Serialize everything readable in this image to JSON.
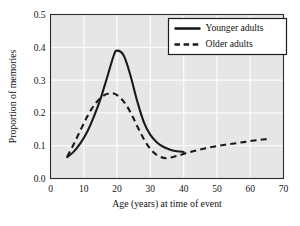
{
  "chart_data": {
    "type": "line",
    "title": "",
    "xlabel": "Age (years) at time of event",
    "ylabel": "Proportion of memories",
    "xlim": [
      0,
      70
    ],
    "ylim": [
      0.0,
      0.5
    ],
    "xticks": [
      "0",
      "10",
      "20",
      "30",
      "40",
      "50",
      "60",
      "70"
    ],
    "yticks": [
      "0.0",
      "0.1",
      "0.2",
      "0.3",
      "0.4",
      "0.5"
    ],
    "grid": true,
    "legend_position": "top-right",
    "background_color": "#e6e6e6",
    "gridline_color": "#fbfbfb",
    "line_color": "#1a1a1a",
    "series": [
      {
        "name": "Younger adults",
        "style": "solid",
        "x": [
          5,
          7,
          9,
          11,
          13,
          15,
          17,
          19,
          20,
          22,
          24,
          26,
          28,
          30,
          32,
          34,
          36,
          38,
          40
        ],
        "values": [
          0.065,
          0.082,
          0.108,
          0.142,
          0.188,
          0.242,
          0.308,
          0.375,
          0.39,
          0.375,
          0.315,
          0.238,
          0.173,
          0.133,
          0.11,
          0.096,
          0.088,
          0.083,
          0.081
        ]
      },
      {
        "name": "Older adults",
        "style": "dashed",
        "x": [
          5,
          7,
          9,
          11,
          13,
          15,
          17,
          19,
          21,
          23,
          25,
          27,
          29,
          31,
          33,
          35,
          38,
          42,
          46,
          50,
          54,
          58,
          62,
          65
        ],
        "values": [
          0.066,
          0.105,
          0.147,
          0.188,
          0.222,
          0.245,
          0.258,
          0.259,
          0.246,
          0.22,
          0.182,
          0.14,
          0.104,
          0.079,
          0.066,
          0.062,
          0.069,
          0.081,
          0.091,
          0.099,
          0.105,
          0.111,
          0.117,
          0.12
        ]
      }
    ]
  },
  "legend": {
    "entries": [
      {
        "label": "Younger adults",
        "style": "solid"
      },
      {
        "label": "Older adults",
        "style": "dashed"
      }
    ]
  }
}
